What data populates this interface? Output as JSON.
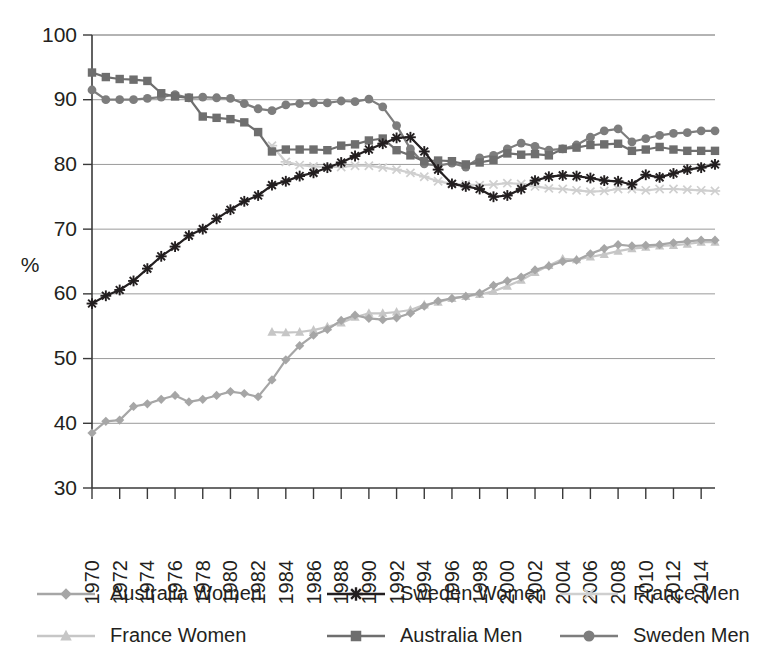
{
  "chart_data": {
    "type": "line",
    "title": "",
    "subtitle": "",
    "xlabel": "",
    "ylabel": "%",
    "ylim": [
      30,
      100
    ],
    "ytick_step": 10,
    "yticks": [
      "30",
      "40",
      "50",
      "60",
      "70",
      "80",
      "90",
      "100"
    ],
    "xlim": [
      1970,
      2015
    ],
    "xtick_step": 2,
    "grid": "horizontal",
    "legend_position": "bottom",
    "xticks": [
      "1970",
      "1972",
      "1974",
      "1976",
      "1978",
      "1980",
      "1982",
      "1984",
      "1986",
      "1988",
      "1990",
      "1992",
      "1994",
      "1996",
      "1998",
      "2000",
      "2002",
      "2004",
      "2006",
      "2008",
      "2010",
      "2012",
      "2014"
    ],
    "x": [
      1970,
      1971,
      1972,
      1973,
      1974,
      1975,
      1976,
      1977,
      1978,
      1979,
      1980,
      1981,
      1982,
      1983,
      1984,
      1985,
      1986,
      1987,
      1988,
      1989,
      1990,
      1991,
      1992,
      1993,
      1994,
      1995,
      1996,
      1997,
      1998,
      1999,
      2000,
      2001,
      2002,
      2003,
      2004,
      2005,
      2006,
      2007,
      2008,
      2009,
      2010,
      2011,
      2012,
      2013,
      2014,
      2015
    ],
    "series": [
      {
        "name": "Australia Women",
        "marker": "diamond",
        "color": "#a6a6a6",
        "values": [
          38.5,
          40.3,
          40.5,
          42.6,
          43.0,
          43.7,
          44.3,
          43.3,
          43.7,
          44.3,
          44.9,
          44.6,
          44.1,
          46.7,
          49.8,
          52.0,
          53.6,
          54.5,
          55.9,
          56.7,
          56.2,
          56.0,
          56.3,
          57.0,
          58.1,
          58.9,
          59.3,
          59.6,
          60.1,
          61.3,
          62.0,
          62.6,
          63.7,
          64.3,
          65.0,
          65.2,
          66.2,
          67.0,
          67.6,
          67.4,
          67.5,
          67.6,
          67.9,
          68.1,
          68.3,
          68.3
        ]
      },
      {
        "name": "France Women",
        "marker": "triangle",
        "color": "#c6c6c6",
        "values": [
          null,
          null,
          null,
          null,
          null,
          null,
          null,
          null,
          null,
          null,
          null,
          null,
          null,
          54.1,
          54.0,
          54.1,
          54.4,
          54.9,
          55.5,
          56.4,
          57.0,
          57.0,
          57.2,
          57.5,
          58.3,
          58.7,
          59.3,
          59.6,
          59.9,
          60.4,
          61.2,
          62.1,
          63.3,
          64.4,
          65.4,
          65.3,
          65.7,
          66.1,
          66.6,
          67.0,
          67.2,
          67.4,
          67.5,
          67.7,
          68.0,
          68.0
        ]
      },
      {
        "name": "Sweden Women",
        "marker": "star",
        "color": "#231f20",
        "values": [
          58.5,
          59.7,
          60.6,
          62.0,
          63.9,
          65.8,
          67.3,
          69.0,
          70.0,
          71.6,
          73.0,
          74.3,
          75.2,
          76.8,
          77.4,
          78.2,
          78.7,
          79.5,
          80.3,
          81.3,
          82.3,
          83.2,
          84.1,
          84.2,
          82.0,
          79.2,
          77.0,
          76.6,
          76.2,
          75.0,
          75.2,
          76.2,
          77.5,
          78.1,
          78.3,
          78.2,
          77.9,
          77.5,
          77.4,
          76.9,
          78.4,
          78.0,
          78.6,
          79.2,
          79.5,
          80.0
        ]
      },
      {
        "name": "Australia Men",
        "marker": "square",
        "color": "#6e6e6e",
        "values": [
          94.2,
          93.5,
          93.2,
          93.1,
          92.9,
          91.0,
          90.5,
          90.3,
          87.4,
          87.2,
          87.0,
          86.5,
          85.0,
          82.0,
          82.3,
          82.3,
          82.3,
          82.2,
          82.9,
          83.1,
          83.7,
          84.0,
          82.2,
          81.4,
          80.5,
          80.6,
          80.5,
          80.0,
          80.3,
          80.7,
          81.7,
          81.5,
          81.6,
          81.4,
          82.4,
          82.6,
          83.0,
          83.1,
          83.2,
          82.1,
          82.3,
          82.7,
          82.3,
          82.1,
          82.1,
          82.1
        ]
      },
      {
        "name": "France Men",
        "marker": "cross",
        "color": "#cfcfcf",
        "values": [
          null,
          null,
          null,
          null,
          null,
          null,
          null,
          null,
          null,
          null,
          null,
          null,
          null,
          82.9,
          80.4,
          79.9,
          79.7,
          79.6,
          79.6,
          79.8,
          79.8,
          79.5,
          79.2,
          78.7,
          78.1,
          77.4,
          77.0,
          76.9,
          76.8,
          76.9,
          77.1,
          77.0,
          76.6,
          76.3,
          76.2,
          76.0,
          75.8,
          75.9,
          76.2,
          76.2,
          76.0,
          76.2,
          76.2,
          76.1,
          76.0,
          75.9
        ]
      },
      {
        "name": "Sweden Men",
        "marker": "circle",
        "color": "#7d7d7d",
        "values": [
          91.5,
          90.0,
          90.0,
          90.0,
          90.2,
          90.4,
          90.8,
          90.3,
          90.4,
          90.3,
          90.2,
          89.4,
          88.6,
          88.3,
          89.2,
          89.4,
          89.5,
          89.5,
          89.8,
          89.7,
          90.1,
          88.9,
          86.0,
          82.4,
          80.1,
          79.8,
          80.2,
          79.6,
          81.0,
          81.4,
          82.4,
          83.3,
          82.8,
          82.2,
          82.4,
          83.0,
          84.2,
          85.2,
          85.5,
          83.5,
          84.0,
          84.5,
          84.8,
          84.9,
          85.2,
          85.2
        ]
      }
    ]
  },
  "legend": {
    "entries": [
      {
        "label": "Australia Women",
        "marker": "diamond",
        "color": "#a6a6a6"
      },
      {
        "label": "France Women",
        "marker": "triangle",
        "color": "#c6c6c6"
      },
      {
        "label": "Sweden Women",
        "marker": "star",
        "color": "#231f20"
      },
      {
        "label": "Australia Men",
        "marker": "square",
        "color": "#6e6e6e"
      },
      {
        "label": "France Men",
        "marker": "cross",
        "color": "#cfcfcf"
      },
      {
        "label": "Sweden Men",
        "marker": "circle",
        "color": "#7d7d7d"
      }
    ]
  },
  "axes": {
    "y_axis_title": "%"
  },
  "colors": {
    "grid": "#9a9a9a",
    "axis": "#3a3a3a",
    "text": "#231f20",
    "background": "#ffffff"
  }
}
